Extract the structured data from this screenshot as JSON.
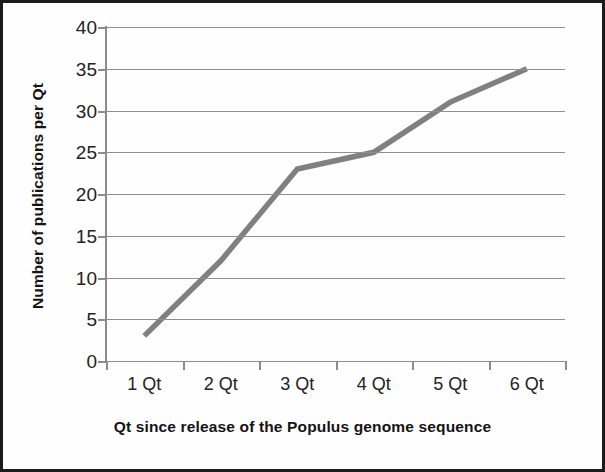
{
  "chart_data": {
    "type": "line",
    "title": "",
    "xlabel": "Qt since release of the Populus genome sequence",
    "ylabel": "Number of publications per Qt",
    "categories": [
      "1 Qt",
      "2 Qt",
      "3 Qt",
      "4 Qt",
      "5 Qt",
      "6 Qt"
    ],
    "values": [
      3,
      12,
      23,
      25,
      31,
      35
    ],
    "series": [
      {
        "name": "Number of publications per Qt",
        "values": [
          3,
          12,
          23,
          25,
          31,
          35
        ]
      }
    ],
    "ylim": [
      0,
      40
    ],
    "ytick_step": 5,
    "yticks": [
      40,
      35,
      30,
      25,
      20,
      15,
      10,
      5,
      0
    ],
    "ytick_labels": [
      "40",
      "35",
      "30",
      "25",
      "20",
      "15",
      "10",
      "5",
      "0"
    ],
    "grid": "horizontal",
    "legend": "none",
    "line_color": "#808080",
    "gridline_color": "#8f8f8f",
    "axis_color": "#8c8c8c",
    "background_color": "#ffffff",
    "border_color": "#1b1b1b"
  }
}
